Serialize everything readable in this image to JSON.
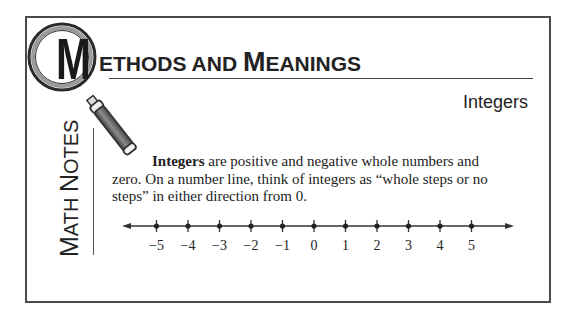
{
  "header": {
    "logo_letter": "M",
    "title_first_cap": "M",
    "title_part1": "ETHODS AND ",
    "title_second_cap": "M",
    "title_part2": "EANINGS",
    "subtitle": "Integers"
  },
  "sidebar": {
    "label_cap1": "M",
    "label_part1": "ATH ",
    "label_cap2": "N",
    "label_part2": "OTES"
  },
  "content": {
    "term": "Integers",
    "definition_rest": " are positive and negative whole numbers and zero. On a number line, think of integers as “whole steps or no steps” in either direction from 0."
  },
  "number_line": {
    "ticks": [
      {
        "label": "−5",
        "value": -5
      },
      {
        "label": "−4",
        "value": -4
      },
      {
        "label": "−3",
        "value": -3
      },
      {
        "label": "−2",
        "value": -2
      },
      {
        "label": "−1",
        "value": -1
      },
      {
        "label": "0",
        "value": 0
      },
      {
        "label": "1",
        "value": 1
      },
      {
        "label": "2",
        "value": 2
      },
      {
        "label": "3",
        "value": 3
      },
      {
        "label": "4",
        "value": 4
      },
      {
        "label": "5",
        "value": 5
      }
    ],
    "arrows": "both"
  },
  "colors": {
    "frame": "#4a4a4a",
    "text": "#222222",
    "handle": "#7a7a7a"
  }
}
